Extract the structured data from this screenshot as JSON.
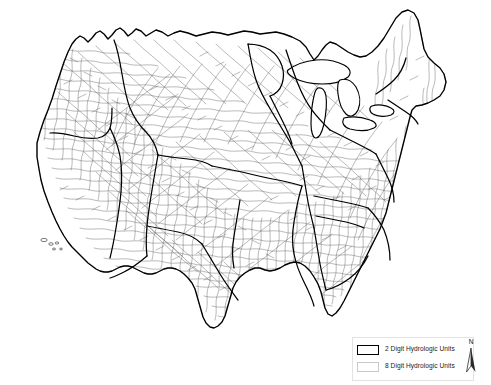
{
  "map": {
    "title": "United States Hydrologic Units",
    "region": "Conterminous United States",
    "background_color": "#ffffff",
    "huc2_line_color": "#000000",
    "huc8_line_color": "#5a5a5a",
    "lake_fill_color": "#ffffff"
  },
  "legend": {
    "frame_color": "#e2e2e2",
    "items": [
      {
        "label": "2 Digit Hydrologic Units",
        "swatch_style": "huc2",
        "border_color": "#000000",
        "fill_color": "#ffffff"
      },
      {
        "label": "8 Digit Hydrologic Units",
        "swatch_style": "huc8",
        "border_color": "#c9c9c9",
        "fill_color": "#ffffff"
      }
    ]
  },
  "north_arrow": {
    "label": "N",
    "icon": "north-arrow-icon"
  }
}
